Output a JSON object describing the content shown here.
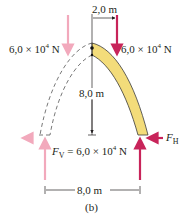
{
  "figure": {
    "caption": "(b)",
    "colors": {
      "arch_fill": "#f3dc7a",
      "arch_stroke": "#3a3a3a",
      "force_strong": "#c8245a",
      "force_faint": "#f2a9bc",
      "line": "#231f20"
    },
    "labels": {
      "top_width": "2,0 m",
      "left_force": "6,0 × 10",
      "left_force_exp": "4",
      "left_force_unit": " N",
      "right_force": "6,0 × 10",
      "right_force_exp": "4",
      "right_force_unit": " N",
      "height": "8,0 m",
      "fv_symbol": "F",
      "fv_sub": "V",
      "fv_value": " = 6,0 × 10",
      "fv_exp": "4",
      "fv_unit": " N",
      "fh_symbol": "F",
      "fh_sub": "H",
      "base_width": "8,0 m"
    }
  }
}
